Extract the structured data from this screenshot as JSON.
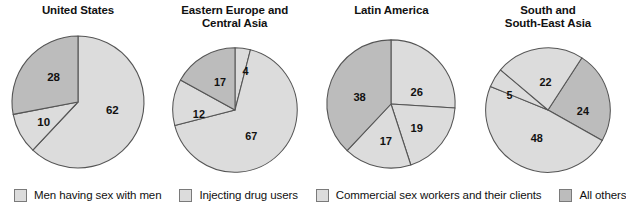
{
  "chart_data": [
    {
      "type": "pie",
      "title": "United States",
      "categories": [
        "Men having sex with men",
        "Injecting drug users",
        "Commercial sex workers and their clients",
        "All others"
      ],
      "values": [
        62,
        10,
        0,
        28
      ],
      "labels": [
        "62",
        "10",
        "",
        "28"
      ],
      "start_angle": 0,
      "direction": "clockwise",
      "legend_position": "bottom"
    },
    {
      "type": "pie",
      "title": "Eastern Europe and\nCentral Asia",
      "categories": [
        "Men having sex with men",
        "Injecting drug users",
        "Commercial sex workers and their clients",
        "All others"
      ],
      "values": [
        4,
        67,
        12,
        17
      ],
      "labels": [
        "4",
        "67",
        "12",
        "17"
      ],
      "start_angle": 0,
      "direction": "clockwise",
      "legend_position": "bottom"
    },
    {
      "type": "pie",
      "title": "Latin America",
      "categories": [
        "Men having sex with men",
        "Injecting drug users",
        "Commercial sex workers and their clients",
        "All others"
      ],
      "values": [
        26,
        19,
        17,
        38
      ],
      "labels": [
        "26",
        "19",
        "17",
        "38"
      ],
      "start_angle": 0,
      "direction": "clockwise",
      "legend_position": "bottom"
    },
    {
      "type": "pie",
      "title": "South and\nSouth-East Asia",
      "categories": [
        "Men having sex with men",
        "Injecting drug users",
        "Commercial sex workers and their clients",
        "All others"
      ],
      "values": [
        5,
        22,
        48,
        24
      ],
      "labels": [
        "5",
        "22",
        "48",
        "24"
      ],
      "start_angle": 0,
      "direction": "clockwise",
      "legend_position": "bottom"
    }
  ],
  "charts": [
    {
      "title": "United States",
      "slices": [
        {
          "label": "62",
          "value": 62,
          "color": "#dcdcdc",
          "start": 0,
          "end": 223.2,
          "lx": 0.52,
          "ly": 0.12
        },
        {
          "label": "",
          "value": 0,
          "color": "#dcdcdc",
          "start": 223.2,
          "end": 223.2,
          "lx": 0,
          "ly": 0
        },
        {
          "label": "10",
          "value": 10,
          "color": "#dcdcdc",
          "start": 223.2,
          "end": 259.2,
          "lx": -0.52,
          "ly": 0.3
        },
        {
          "label": "28",
          "value": 28,
          "color": "#bcbcbc",
          "start": 259.2,
          "end": 360,
          "lx": -0.37,
          "ly": -0.38
        }
      ]
    },
    {
      "title": "Eastern Europe and\nCentral Asia",
      "slices": [
        {
          "label": "4",
          "value": 4,
          "color": "#dcdcdc",
          "start": 0,
          "end": 14.4,
          "lx": 0.17,
          "ly": -0.62
        },
        {
          "label": "67",
          "value": 67,
          "color": "#dcdcdc",
          "start": 14.4,
          "end": 255.6,
          "lx": 0.26,
          "ly": 0.42
        },
        {
          "label": "12",
          "value": 12,
          "color": "#dcdcdc",
          "start": 255.6,
          "end": 298.8,
          "lx": -0.58,
          "ly": 0.06
        },
        {
          "label": "17",
          "value": 17,
          "color": "#bcbcbc",
          "start": 298.8,
          "end": 360,
          "lx": -0.24,
          "ly": -0.44
        }
      ]
    },
    {
      "title": "Latin America",
      "slices": [
        {
          "label": "26",
          "value": 26,
          "color": "#dcdcdc",
          "start": 0,
          "end": 93.6,
          "lx": 0.4,
          "ly": -0.18
        },
        {
          "label": "19",
          "value": 19,
          "color": "#dcdcdc",
          "start": 93.6,
          "end": 162,
          "lx": 0.4,
          "ly": 0.38
        },
        {
          "label": "17",
          "value": 17,
          "color": "#dcdcdc",
          "start": 162,
          "end": 223.2,
          "lx": -0.08,
          "ly": 0.58
        },
        {
          "label": "38",
          "value": 38,
          "color": "#bcbcbc",
          "start": 223.2,
          "end": 360,
          "lx": -0.49,
          "ly": -0.1
        }
      ]
    },
    {
      "title": "South and\nSouth-East Asia",
      "slices": [
        {
          "label": "24",
          "value": 24,
          "color": "#bcbcbc",
          "start": 33,
          "end": 119.4,
          "lx": 0.56,
          "ly": 0.02
        },
        {
          "label": "48",
          "value": 48,
          "color": "#dcdcdc",
          "start": 119.4,
          "end": 292.2,
          "lx": -0.18,
          "ly": 0.46
        },
        {
          "label": "5",
          "value": 5,
          "color": "#dcdcdc",
          "start": 292.2,
          "end": 310.2,
          "lx": -0.62,
          "ly": -0.24
        },
        {
          "label": "22",
          "value": 22,
          "color": "#dcdcdc",
          "start": 310.2,
          "end": 393,
          "lx": -0.04,
          "ly": -0.44
        }
      ]
    }
  ],
  "legend": {
    "items": [
      {
        "label": "Men having sex with men",
        "color": "#dcdcdc"
      },
      {
        "label": "Injecting drug users",
        "color": "#dcdcdc"
      },
      {
        "label": "Commercial sex workers and their clients",
        "color": "#dcdcdc"
      },
      {
        "label": "All others",
        "color": "#bcbcbc"
      }
    ]
  },
  "colors": {
    "slice_light": "#dcdcdc",
    "slice_dark": "#bcbcbc",
    "outline": "#555555",
    "text": "#111111",
    "background": "#ffffff"
  }
}
